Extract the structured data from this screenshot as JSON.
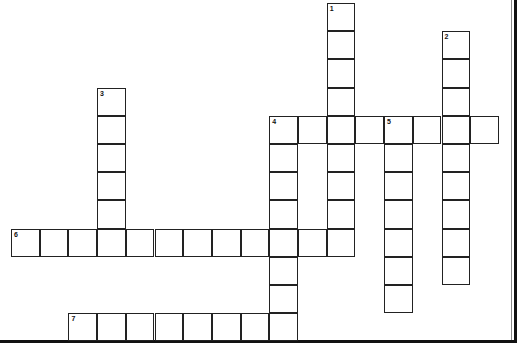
{
  "puzzle": {
    "type": "crossword",
    "grid": {
      "origin_x": 11,
      "origin_y": 3,
      "cell_w": 28.7,
      "cell_h": 28.2
    },
    "entries": [
      {
        "number": "1",
        "direction": "down",
        "row": 0,
        "col": 11,
        "length": 9
      },
      {
        "number": "2",
        "direction": "down",
        "row": 1,
        "col": 15,
        "length": 9
      },
      {
        "number": "3",
        "direction": "down",
        "row": 3,
        "col": 3,
        "length": 6
      },
      {
        "number": "4",
        "direction": "across",
        "row": 4,
        "col": 9,
        "length": 8
      },
      {
        "number": "4",
        "direction": "down",
        "row": 4,
        "col": 9,
        "length": 8
      },
      {
        "number": "5",
        "direction": "down",
        "row": 4,
        "col": 13,
        "length": 7
      },
      {
        "number": "6",
        "direction": "across",
        "row": 8,
        "col": 0,
        "length": 12
      },
      {
        "number": "7",
        "direction": "across",
        "row": 11,
        "col": 2,
        "length": 8
      }
    ]
  }
}
